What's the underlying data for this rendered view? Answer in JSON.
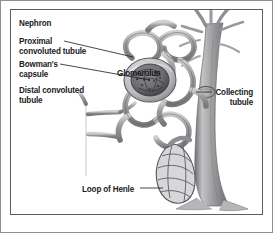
{
  "figure": {
    "kind": "anatomical-diagram",
    "subject": "Nephron",
    "background_color": "#ffffff",
    "frame_color": "#5b5d5f",
    "outer_border_color": "#8d8f91",
    "ink_color": "#1b1b1b",
    "tubule_fill": "#a9a9ab",
    "tubule_stroke": "#5f6062"
  },
  "labels": {
    "title": "Nephron",
    "proximal": "Proximal\nconvoluted tubule",
    "bowmans": "Bowman's\ncapsule",
    "distal": "Distal convoluted\ntubule",
    "glomerulus": "Glomerulus",
    "collecting": "Collecting\ntubule",
    "loop": "Loop of Henle"
  },
  "leader_lines": [
    {
      "name": "proximal-leader",
      "from": [
        64,
        41
      ],
      "to": [
        133,
        57
      ]
    },
    {
      "name": "bowmans-leader",
      "from": [
        60,
        64
      ],
      "to": [
        150,
        80
      ]
    },
    {
      "name": "collecting-leader",
      "from": [
        196,
        92
      ],
      "to": [
        212,
        92
      ]
    },
    {
      "name": "loop-leader",
      "from": [
        140,
        188
      ],
      "to": [
        163,
        188
      ]
    }
  ]
}
